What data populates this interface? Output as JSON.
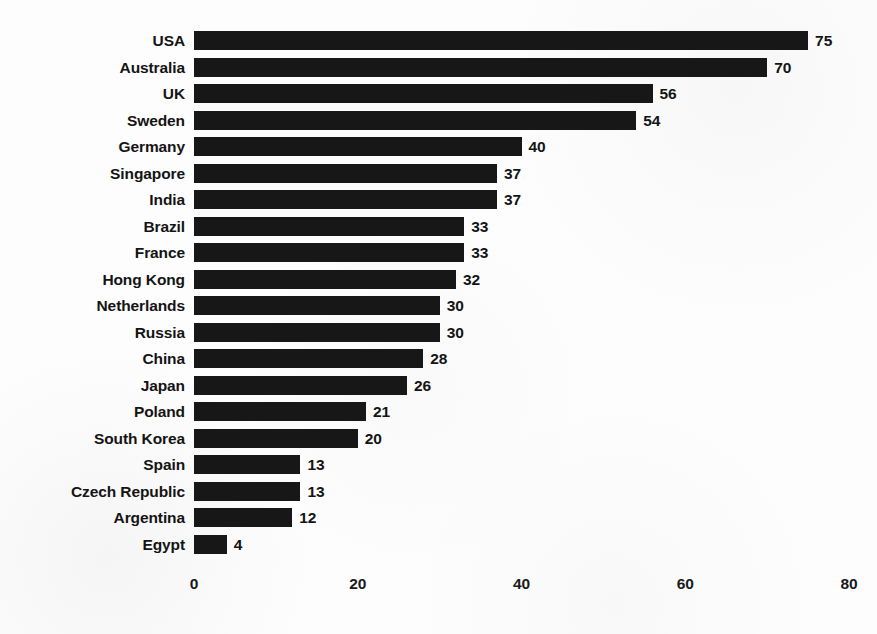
{
  "chart_data": {
    "type": "bar",
    "orientation": "horizontal",
    "title": "",
    "subtitle": "",
    "xlabel": "",
    "ylabel": "",
    "xlim": [
      0,
      80
    ],
    "xticks": [
      "0",
      "20",
      "40",
      "60",
      "80"
    ],
    "grid": false,
    "legend": null,
    "show_value_labels": true,
    "bar_color": "#171717",
    "background_color": "#fdfdfd",
    "text_color": "#141414",
    "categories": [
      "USA",
      "Australia",
      "UK",
      "Sweden",
      "Germany",
      "Singapore",
      "India",
      "Brazil",
      "France",
      "Hong Kong",
      "Netherlands",
      "Russia",
      "China",
      "Japan",
      "Poland",
      "South Korea",
      "Spain",
      "Czech Republic",
      "Argentina",
      "Egypt"
    ],
    "values": [
      75,
      70,
      56,
      54,
      40,
      37,
      37,
      33,
      33,
      32,
      30,
      30,
      28,
      26,
      21,
      20,
      13,
      13,
      12,
      4
    ],
    "value_labels": [
      "75",
      "70",
      "56",
      "54",
      "40",
      "37",
      "37",
      "33",
      "33",
      "32",
      "30",
      "30",
      "28",
      "26",
      "21",
      "20",
      "13",
      "13",
      "12",
      "4"
    ]
  }
}
